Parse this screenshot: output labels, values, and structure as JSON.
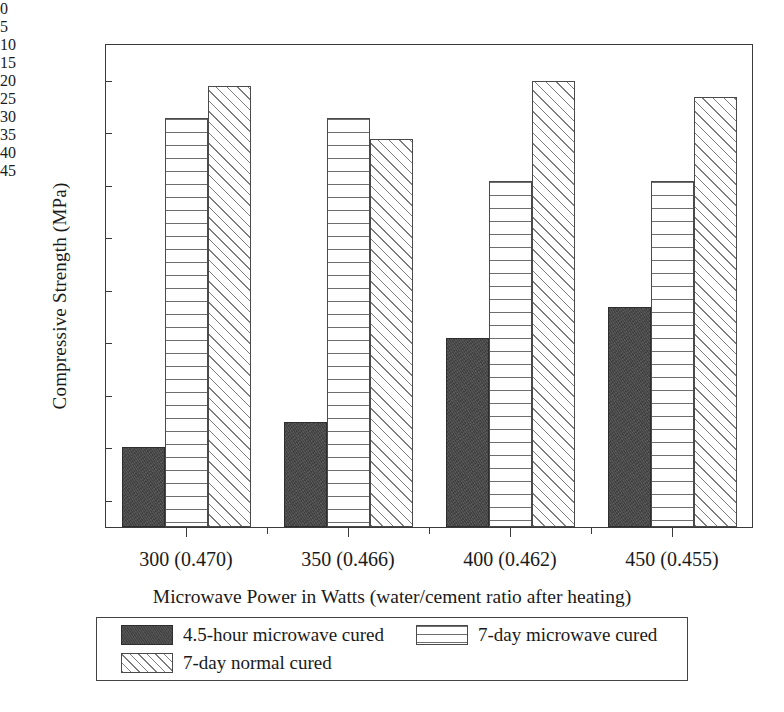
{
  "chart_data": {
    "type": "bar",
    "title": "",
    "xlabel": "Microwave Power in Watts (water/cement ratio after heating)",
    "ylabel": "Compressive Strength (MPa)",
    "categories": [
      "300 (0.470)",
      "350 (0.466)",
      "400 (0.462)",
      "450 (0.455)"
    ],
    "series": [
      {
        "name": "4.5-hour microwave cured",
        "pattern": "solid-dark",
        "values": [
          7.6,
          10.0,
          18.0,
          21.0
        ]
      },
      {
        "name": "7-day microwave cured",
        "pattern": "horizontal-lines",
        "values": [
          39.0,
          39.0,
          33.0,
          33.0
        ]
      },
      {
        "name": "7-day normal cured",
        "pattern": "diagonal-hatch",
        "values": [
          42.0,
          37.0,
          42.5,
          41.0
        ]
      }
    ],
    "ylim": [
      0,
      46
    ],
    "yticks": [
      0,
      5,
      10,
      15,
      20,
      25,
      30,
      35,
      40,
      45
    ],
    "yticks_minor": [
      2.5,
      7.5,
      12.5,
      17.5,
      22.5,
      27.5,
      32.5,
      37.5,
      42.5
    ],
    "grid": false,
    "legend_position": "bottom-outside",
    "legend_columns": 2
  },
  "axis": {
    "y_title": "Compressive Strength (MPa)",
    "x_title": "Microwave Power in Watts (water/cement ratio after heating)",
    "y_tick_labels": [
      "0",
      "5",
      "10",
      "15",
      "20",
      "25",
      "30",
      "35",
      "40",
      "45"
    ],
    "x_tick_labels": [
      "300 (0.470)",
      "350 (0.466)",
      "400 (0.462)",
      "450 (0.455)"
    ]
  },
  "legend": {
    "entries": [
      {
        "label": "4.5-hour microwave cured",
        "pattern": "solid-dark"
      },
      {
        "label": "7-day microwave cured",
        "pattern": "horizontal-lines"
      },
      {
        "label": "7-day normal cured",
        "pattern": "diagonal-hatch"
      }
    ]
  },
  "colors": {
    "solid_fill": "#474747",
    "line_stroke": "#6e6e6e",
    "hatch_stroke": "#7d7d7d",
    "axis": "#3a3a3a",
    "background": "#ffffff",
    "text": "#1a1a1a"
  }
}
